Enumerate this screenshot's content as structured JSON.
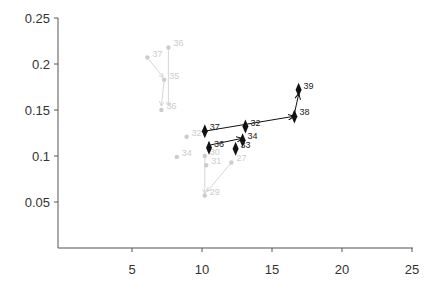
{
  "chart_data": {
    "type": "scatter",
    "title": "",
    "xlabel": "",
    "ylabel": "",
    "xlim": [
      0,
      25
    ],
    "ylim": [
      0,
      0.25
    ],
    "x_ticks": [
      5,
      10,
      15,
      20,
      25
    ],
    "y_ticks": [
      0.05,
      0.1,
      0.15,
      0.2,
      0.25
    ],
    "grid": false,
    "legend": null,
    "series": [
      {
        "name": "highlighted",
        "color": "#111111",
        "marker": "diamond",
        "points": [
          {
            "label": "37",
            "x": 10.2,
            "y": 0.127
          },
          {
            "label": "36",
            "x": 10.5,
            "y": 0.109
          },
          {
            "label": "32",
            "x": 13.1,
            "y": 0.132
          },
          {
            "label": "34",
            "x": 12.9,
            "y": 0.117
          },
          {
            "label": "33",
            "x": 12.4,
            "y": 0.108
          },
          {
            "label": "38",
            "x": 16.6,
            "y": 0.143
          },
          {
            "label": "39",
            "x": 16.9,
            "y": 0.172
          }
        ],
        "arrows": [
          {
            "from": [
              10.2,
              0.127
            ],
            "to": [
              16.5,
              0.143
            ]
          },
          {
            "from": [
              10.6,
              0.112
            ],
            "to": [
              12.8,
              0.119
            ]
          },
          {
            "from": [
              16.6,
              0.146
            ],
            "to": [
              16.9,
              0.167
            ]
          }
        ]
      },
      {
        "name": "faded",
        "color": "#cccccc",
        "marker": "circle",
        "points": [
          {
            "label": "37",
            "x": 6.1,
            "y": 0.207
          },
          {
            "label": "36",
            "x": 7.6,
            "y": 0.218
          },
          {
            "label": "35",
            "x": 7.3,
            "y": 0.183
          },
          {
            "label": "36",
            "x": 7.1,
            "y": 0.15
          },
          {
            "label": "32",
            "x": 8.9,
            "y": 0.121
          },
          {
            "label": "34",
            "x": 8.2,
            "y": 0.099
          },
          {
            "label": "30",
            "x": 10.2,
            "y": 0.1
          },
          {
            "label": "31",
            "x": 10.3,
            "y": 0.09
          },
          {
            "label": "27",
            "x": 12.1,
            "y": 0.093
          },
          {
            "label": "29",
            "x": 10.2,
            "y": 0.057
          }
        ],
        "arrows": [
          {
            "from": [
              6.1,
              0.207
            ],
            "to": [
              7.2,
              0.186
            ]
          },
          {
            "from": [
              7.6,
              0.218
            ],
            "to": [
              7.6,
              0.155
            ]
          },
          {
            "from": [
              7.3,
              0.183
            ],
            "to": [
              7.1,
              0.155
            ]
          },
          {
            "from": [
              12.1,
              0.093
            ],
            "to": [
              10.4,
              0.062
            ]
          },
          {
            "from": [
              10.2,
              0.1
            ],
            "to": [
              10.2,
              0.06
            ]
          }
        ]
      }
    ]
  }
}
